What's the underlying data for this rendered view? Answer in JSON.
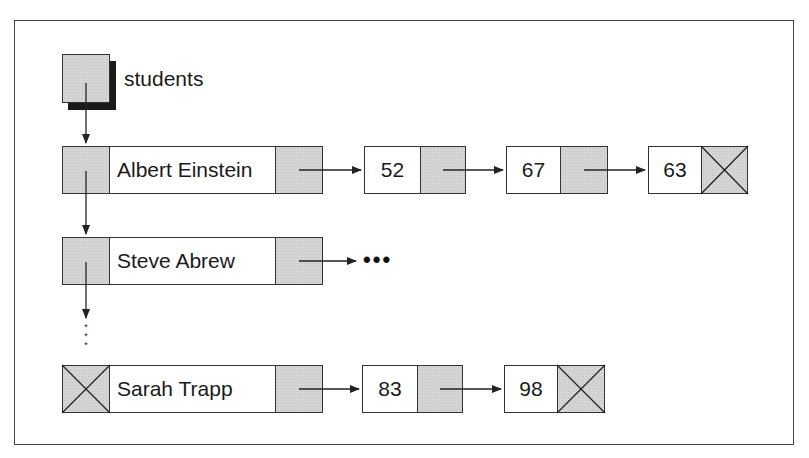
{
  "diagram": {
    "head_pointer": {
      "label": "students"
    },
    "rows": [
      {
        "name": "Albert Einstein",
        "grades": [
          "52",
          "67",
          "63"
        ],
        "grades_truncated": false,
        "next_null": false
      },
      {
        "name": "Steve Abrew",
        "grades": [],
        "grades_truncated": true,
        "continuation": "•••",
        "next_null": false
      },
      {
        "name": "Sarah Trapp",
        "grades": [
          "83",
          "98"
        ],
        "grades_truncated": false,
        "next_null": true
      }
    ],
    "vertical_ellipsis": [
      "*",
      "*",
      "*"
    ],
    "colors": {
      "pointer_fill": "#d4d4d4",
      "border": "#333333",
      "shadow": "#1a1a1a",
      "background": "#ffffff"
    }
  }
}
